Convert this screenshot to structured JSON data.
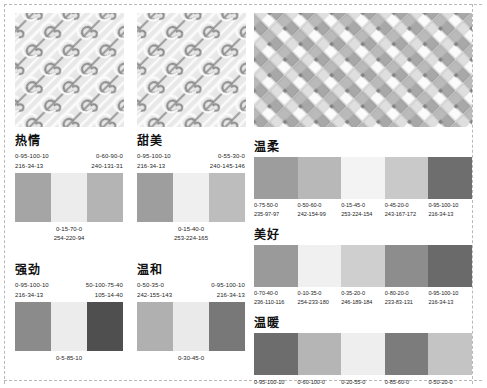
{
  "page": {
    "background": "#ffffff",
    "trim_marks": true
  },
  "patterns": [
    {
      "name": "swirl-pattern-left",
      "label": "旋涡纹样",
      "style": "diagonal-spiral",
      "base_color": "#e6e6e6",
      "line_color": "#8c8c8c",
      "highlight_color": "#f6f6f6"
    },
    {
      "name": "swirl-pattern-middle",
      "label": "旋涡纹样",
      "style": "diagonal-spiral",
      "base_color": "#e6e6e6",
      "line_color": "#8c8c8c",
      "highlight_color": "#f6f6f6"
    },
    {
      "name": "basketweave-pattern-right",
      "label": "编织纹样",
      "style": "basket-weave",
      "base_color": "#e2e2e2",
      "line_color": "#9a9a9a",
      "highlight_color": "#fafafa"
    }
  ],
  "left_groups": [
    {
      "id": "reqing",
      "title": "热情",
      "top_left": {
        "cmyk": "0-95-100-10",
        "rgb": "216-34-13"
      },
      "top_right": {
        "cmyk": "0-60-90-0",
        "rgb": "240-131-31"
      },
      "bottom": {
        "cmyk": "0-15-70-0",
        "rgb": "254-220-94"
      },
      "swatches": [
        "#a5a5a5",
        "#ececec",
        "#b4b4b4"
      ]
    },
    {
      "id": "tianmei",
      "title": "甜美",
      "top_left": {
        "cmyk": "0-95-100-10",
        "rgb": "216-34-13"
      },
      "top_right": {
        "cmyk": "0-55-30-0",
        "rgb": "240-145-146"
      },
      "bottom": {
        "cmyk": "0-15-40-0",
        "rgb": "253-224-165"
      },
      "swatches": [
        "#9e9e9e",
        "#efefef",
        "#bdbdbd"
      ]
    },
    {
      "id": "qiangjing",
      "title": "强劲",
      "top_left": {
        "cmyk": "0-95-100-10",
        "rgb": "216-34-13"
      },
      "top_right": {
        "cmyk": "50-100-75-40",
        "rgb": "105-14-40"
      },
      "bottom": {
        "cmyk": "0-5-85-10",
        "rgb": ""
      },
      "swatches": [
        "#8b8b8b",
        "#ececec",
        "#4f4f4f"
      ]
    },
    {
      "id": "wenhe",
      "title": "温和",
      "top_left": {
        "cmyk": "0-50-35-0",
        "rgb": "242-155-143"
      },
      "top_right": {
        "cmyk": "0-95-100-10",
        "rgb": "216-34-13"
      },
      "bottom": {
        "cmyk": "0-30-45-0",
        "rgb": ""
      },
      "swatches": [
        "#b0b0b0",
        "#eaeaea",
        "#787878"
      ]
    }
  ],
  "right_groups": [
    {
      "id": "wenrou",
      "title": "温柔",
      "swatches": [
        "#9d9d9d",
        "#b8b8b8",
        "#f3f3f3",
        "#c9c9c9",
        "#6e6e6e"
      ],
      "codes": [
        {
          "cmyk": "0-75-50-0",
          "rgb": "235-97-97"
        },
        {
          "cmyk": "0-50-60-0",
          "rgb": "242-154-99"
        },
        {
          "cmyk": "0-15-45-0",
          "rgb": "253-224-154"
        },
        {
          "cmyk": "0-45-20-0",
          "rgb": "243-167-172"
        },
        {
          "cmyk": "0-95-100-10",
          "rgb": "216-34-13"
        }
      ]
    },
    {
      "id": "meihao",
      "title": "美好",
      "swatches": [
        "#9a9a9a",
        "#f0f0f0",
        "#cfcfcf",
        "#8d8d8d",
        "#6a6a6a"
      ],
      "codes": [
        {
          "cmyk": "0-70-40-0",
          "rgb": "236-110-116"
        },
        {
          "cmyk": "0-10-35-0",
          "rgb": "254-233-180"
        },
        {
          "cmyk": "0-35-20-0",
          "rgb": "246-189-184"
        },
        {
          "cmyk": "0-80-20-0",
          "rgb": "233-83-131"
        },
        {
          "cmyk": "0-95-100-10",
          "rgb": "216-34-13"
        }
      ]
    },
    {
      "id": "wennuan",
      "title": "温暖",
      "swatches": [
        "#6d6d6d",
        "#b5b5b5",
        "#eeeeee",
        "#7c7c7c",
        "#c4c4c4"
      ],
      "codes": [
        {
          "cmyk": "0-95-100-10",
          "rgb": ""
        },
        {
          "cmyk": "0-60-100-0",
          "rgb": ""
        },
        {
          "cmyk": "0-20-55-0",
          "rgb": ""
        },
        {
          "cmyk": "0-85-60-0",
          "rgb": ""
        },
        {
          "cmyk": "0-50-20-0",
          "rgb": ""
        }
      ]
    }
  ]
}
